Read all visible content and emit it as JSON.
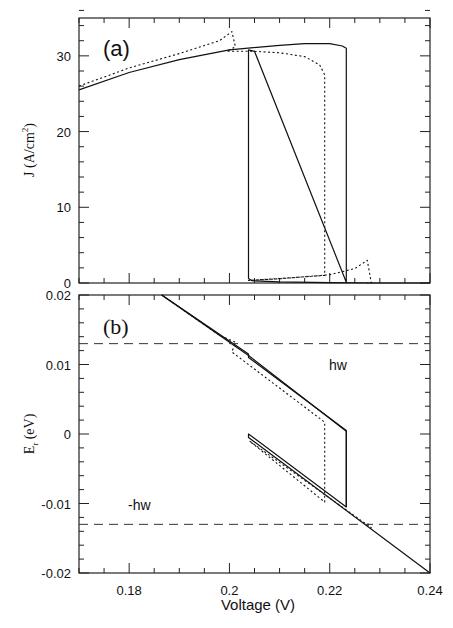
{
  "chart_data": [
    {
      "type": "line",
      "panel": "(a)",
      "xlabel": "Voltage (V)",
      "ylabel": "J (A/cm²)",
      "xlim": [
        0.17,
        0.24
      ],
      "ylim": [
        0,
        35
      ],
      "xticks": [
        "0.18",
        "0.2",
        "0.22",
        "0.24"
      ],
      "yticks": [
        "0",
        "10",
        "20",
        "30"
      ],
      "series": [
        {
          "name": "solid",
          "style": "solid",
          "x": [
            0.17,
            0.18,
            0.19,
            0.2,
            0.21,
            0.215,
            0.22,
            0.2225,
            0.2233,
            0.2233,
            0.205,
            0.2038,
            0.2038,
            0.2045,
            0.21,
            0.22,
            0.23,
            0.24
          ],
          "y": [
            25.5,
            27.8,
            29.5,
            30.8,
            31.4,
            31.6,
            31.6,
            31.3,
            31.0,
            0.1,
            30.6,
            30.8,
            0.6,
            0.3,
            0.15,
            0.05,
            0.0,
            0.0
          ]
        },
        {
          "name": "dotted",
          "style": "dotted",
          "x": [
            0.17,
            0.18,
            0.19,
            0.198,
            0.2005,
            0.2012,
            0.1995,
            0.1995,
            0.205,
            0.21,
            0.215,
            0.218,
            0.219,
            0.219,
            0.21,
            0.205,
            0.2038,
            0.21,
            0.22,
            0.225,
            0.2275,
            0.2283,
            0.2275
          ],
          "y": [
            26.0,
            28.4,
            30.3,
            32.0,
            33.2,
            31.2,
            30.6,
            30.6,
            30.6,
            30.4,
            29.9,
            28.8,
            27.5,
            1.0,
            0.6,
            0.4,
            0.35,
            0.55,
            1.1,
            1.9,
            3.0,
            0.0,
            0.0
          ]
        }
      ]
    },
    {
      "type": "line",
      "panel": "(b)",
      "xlabel": "Voltage (V)",
      "ylabel": "E_r (eV)",
      "xlim": [
        0.17,
        0.24
      ],
      "ylim": [
        -0.02,
        0.02
      ],
      "xticks": [
        "0.18",
        "0.2",
        "0.22",
        "0.24"
      ],
      "yticks": [
        "-0.02",
        "-0.01",
        "0",
        "0.01",
        "0.02"
      ],
      "annotations": [
        "hw",
        "-hw"
      ],
      "hlines": [
        0.013,
        -0.013
      ],
      "series": [
        {
          "name": "solid",
          "style": "solid",
          "x": [
            0.1865,
            0.2038,
            0.2038,
            0.2233,
            0.2233,
            0.2038,
            0.2038,
            0.24
          ],
          "y": [
            0.02,
            0.0115,
            0.011,
            0.0005,
            -0.0105,
            0.0,
            -0.0005,
            -0.02
          ]
        },
        {
          "name": "dotted",
          "style": "dotted",
          "x": [
            0.1865,
            0.198,
            0.2012,
            0.2005,
            0.219,
            0.219,
            0.204,
            0.2283,
            0.2275
          ],
          "y": [
            0.02,
            0.0142,
            0.0132,
            0.0118,
            0.0017,
            -0.0098,
            -0.001,
            -0.0135,
            -0.0128
          ]
        },
        {
          "name": "solid-upper-branch",
          "style": "solid",
          "x": [
            0.1865,
            0.2038,
            0.2233,
            0.2233
          ],
          "y": [
            0.02,
            0.0113,
            0.0004,
            -0.0105
          ]
        }
      ]
    }
  ],
  "labels": {
    "panel_a": "(a)",
    "panel_b": "(b)",
    "hw": "hw",
    "neg_hw": "-hw",
    "xlabel": "Voltage (V)",
    "ylabel_a": "J (A/cm",
    "ylabel_a_sup": "2",
    "ylabel_a_end": ")",
    "ylabel_b": "E",
    "ylabel_b_sub": "r",
    "ylabel_b_end": " (eV)"
  }
}
